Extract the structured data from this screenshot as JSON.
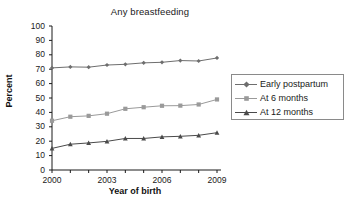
{
  "chart_data": {
    "type": "line",
    "title": "Any breastfeeding",
    "xlabel": "Year of birth",
    "ylabel": "Percent",
    "x": [
      2000,
      2001,
      2002,
      2003,
      2004,
      2005,
      2006,
      2007,
      2008,
      2009
    ],
    "categories": [
      "2000",
      "2001",
      "2002",
      "2003",
      "2004",
      "2005",
      "2006",
      "2007",
      "2008",
      "2009"
    ],
    "xlim": [
      2000,
      2009
    ],
    "ylim": [
      0,
      100
    ],
    "ytick_labels": [
      "0",
      "10",
      "20",
      "30",
      "40",
      "50",
      "60",
      "70",
      "80",
      "90",
      "100"
    ],
    "yticks": [
      0,
      10,
      20,
      30,
      40,
      50,
      60,
      70,
      80,
      90,
      100
    ],
    "xtick_labels_shown": [
      "2000",
      "2003",
      "2006",
      "2009"
    ],
    "xticks_shown": [
      2000,
      2003,
      2006,
      2009
    ],
    "grid": false,
    "legend_position": "right",
    "series": [
      {
        "name": "Early postpartum",
        "marker": "diamond",
        "color": "#6e6e6e",
        "values": [
          70.9,
          71.6,
          71.4,
          72.9,
          73.4,
          74.4,
          74.8,
          76.0,
          75.7,
          77.8
        ]
      },
      {
        "name": "At 6 months",
        "marker": "square",
        "color": "#9a9a9a",
        "values": [
          34.2,
          37.0,
          37.6,
          39.1,
          42.5,
          43.6,
          44.6,
          44.7,
          45.5,
          49.0
        ]
      },
      {
        "name": "At 12 months",
        "marker": "triangle",
        "color": "#4a4a4a",
        "values": [
          15.0,
          17.9,
          18.8,
          19.9,
          21.9,
          21.9,
          23.0,
          23.4,
          24.1,
          25.9
        ]
      }
    ]
  },
  "legend": {
    "items": [
      {
        "label": "Early postpartum"
      },
      {
        "label": "At 6 months"
      },
      {
        "label": "At 12 months"
      }
    ]
  },
  "colors": {
    "axis": "#1a1a1a",
    "series_1": "#6e6e6e",
    "series_2": "#9a9a9a",
    "series_3": "#4a4a4a",
    "background": "#ffffff"
  }
}
